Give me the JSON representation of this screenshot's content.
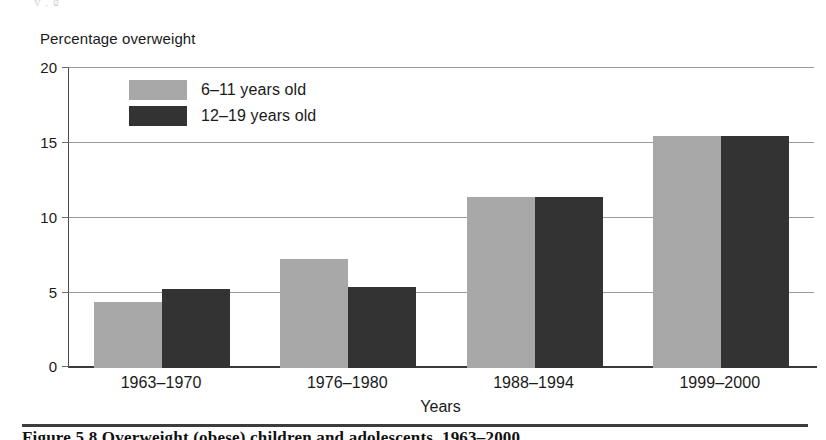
{
  "figure": {
    "caption": "Figure 5.8  Overweight (obese) children and adolescents, 1963–2000",
    "bleed_text": "                                                         y                         ,          g"
  },
  "chart_data": {
    "type": "bar",
    "title": "",
    "ylabel": "Percentage overweight",
    "xlabel": "Years",
    "categories": [
      "1963–1970",
      "1976–1980",
      "1988–1994",
      "1999–2000"
    ],
    "series": [
      {
        "name": "6–11 years old",
        "color": "#a8a8a8",
        "values": [
          4.4,
          7.3,
          11.4,
          15.5
        ]
      },
      {
        "name": "12–19 years old",
        "color": "#333333",
        "values": [
          5.3,
          5.4,
          11.4,
          15.5
        ]
      }
    ],
    "ylim": [
      0,
      20
    ],
    "yticks": [
      0,
      5,
      10,
      15,
      20
    ],
    "ytick_labels": [
      "0",
      "5",
      "10",
      "15",
      "20"
    ],
    "grid": true,
    "legend_position": "upper-left-inside"
  }
}
